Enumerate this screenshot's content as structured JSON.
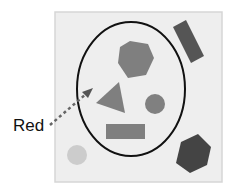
{
  "diagram": {
    "label": "Red",
    "colors": {
      "panel": "#eeeeee",
      "panel_border": "#d6d6d6",
      "shape_medium": "#7f7f7f",
      "shape_dark": "#444444",
      "shape_light": "#cccccc",
      "ellipse_stroke": "#111111",
      "arrow": "#666666"
    },
    "shapes": [
      {
        "type": "hexagon",
        "shade": "medium",
        "inside_ellipse": true
      },
      {
        "type": "triangle",
        "shade": "medium",
        "inside_ellipse": true
      },
      {
        "type": "circle",
        "shade": "medium",
        "inside_ellipse": true
      },
      {
        "type": "rectangle",
        "shade": "medium",
        "inside_ellipse": true
      },
      {
        "type": "rotated-rectangle",
        "shade": "dark",
        "inside_ellipse": false
      },
      {
        "type": "hexagon",
        "shade": "dark",
        "inside_ellipse": false
      },
      {
        "type": "circle",
        "shade": "light",
        "inside_ellipse": false
      }
    ]
  }
}
